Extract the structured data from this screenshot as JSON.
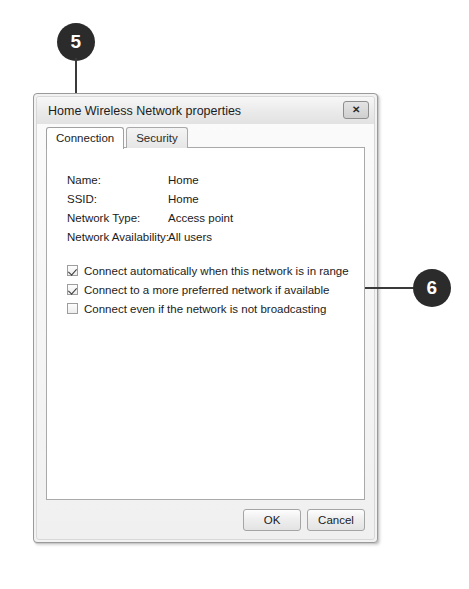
{
  "callouts": [
    {
      "number": "5",
      "target": "connection-tab"
    },
    {
      "number": "6",
      "target": "checkbox-group"
    }
  ],
  "dialog": {
    "title": "Home Wireless Network properties",
    "close_icon": "✕",
    "tabs": [
      {
        "label": "Connection",
        "active": true
      },
      {
        "label": "Security",
        "active": false
      }
    ],
    "properties": [
      {
        "label": "Name:",
        "value": "Home"
      },
      {
        "label": "SSID:",
        "value": "Home"
      },
      {
        "label": "Network Type:",
        "value": "Access point"
      },
      {
        "label": "Network Availability:",
        "value": "All users"
      }
    ],
    "checkboxes": [
      {
        "label": "Connect automatically when this network is in range",
        "checked": true
      },
      {
        "label": "Connect to a more preferred network if available",
        "checked": true
      },
      {
        "label": "Connect even if the network is not broadcasting",
        "checked": false
      }
    ],
    "buttons": [
      {
        "label": "OK",
        "name": "ok-button"
      },
      {
        "label": "Cancel",
        "name": "cancel-button"
      }
    ]
  }
}
